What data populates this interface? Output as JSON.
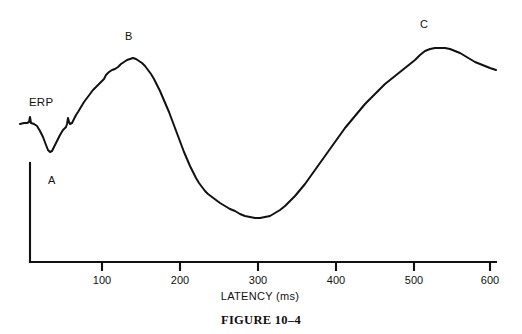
{
  "figure": {
    "caption": "FIGURE 10–4",
    "background_color": "#ffffff",
    "trace_color": "#111111",
    "axis_color": "#111111"
  },
  "chart_data": {
    "type": "line",
    "title": "",
    "subtitle": "",
    "xlabel": "LATENCY (ms)",
    "ylabel": "",
    "grid": false,
    "legend_position": "none",
    "xlim": [
      0,
      645
    ],
    "ylim": [
      -1,
      1
    ],
    "x_ticks": [
      100,
      200,
      300,
      400,
      500,
      600
    ],
    "x_tick_labels": [
      "100",
      "200",
      "300",
      "400",
      "500",
      "600"
    ],
    "y_ticks": [],
    "y_tick_labels": [],
    "series": [
      {
        "name": "ERP",
        "points_px": [
          [
            20,
            124
          ],
          [
            24,
            123
          ],
          [
            27,
            123
          ],
          [
            29,
            122
          ],
          [
            30,
            117
          ],
          [
            31,
            123
          ],
          [
            34,
            124
          ],
          [
            37,
            126
          ],
          [
            40,
            131
          ],
          [
            43,
            137
          ],
          [
            46,
            145
          ],
          [
            48,
            150
          ],
          [
            50,
            152
          ],
          [
            52,
            151
          ],
          [
            54,
            147
          ],
          [
            57,
            141
          ],
          [
            60,
            135
          ],
          [
            63,
            130
          ],
          [
            66,
            127
          ],
          [
            67,
            124
          ],
          [
            68,
            118
          ],
          [
            69,
            122
          ],
          [
            70,
            124
          ],
          [
            72,
            123
          ],
          [
            74,
            119
          ],
          [
            76,
            115
          ],
          [
            78,
            112
          ],
          [
            81,
            107
          ],
          [
            84,
            102
          ],
          [
            87,
            98
          ],
          [
            90,
            94
          ],
          [
            93,
            90
          ],
          [
            96,
            87
          ],
          [
            99,
            84
          ],
          [
            102,
            81
          ],
          [
            104,
            79
          ],
          [
            106,
            75
          ],
          [
            109,
            72
          ],
          [
            112,
            70
          ],
          [
            115,
            69
          ],
          [
            118,
            67
          ],
          [
            121,
            64
          ],
          [
            124,
            62
          ],
          [
            127,
            60
          ],
          [
            130,
            59
          ],
          [
            133,
            58
          ],
          [
            136,
            59
          ],
          [
            139,
            61
          ],
          [
            142,
            63
          ],
          [
            145,
            66
          ],
          [
            148,
            70
          ],
          [
            151,
            74
          ],
          [
            154,
            79
          ],
          [
            157,
            85
          ],
          [
            160,
            91
          ],
          [
            163,
            98
          ],
          [
            166,
            105
          ],
          [
            169,
            112
          ],
          [
            172,
            120
          ],
          [
            175,
            128
          ],
          [
            178,
            136
          ],
          [
            181,
            144
          ],
          [
            184,
            152
          ],
          [
            187,
            159
          ],
          [
            190,
            166
          ],
          [
            193,
            172
          ],
          [
            196,
            178
          ],
          [
            199,
            183
          ],
          [
            202,
            187
          ],
          [
            205,
            191
          ],
          [
            208,
            194
          ],
          [
            212,
            197
          ],
          [
            216,
            200
          ],
          [
            220,
            203
          ],
          [
            225,
            206
          ],
          [
            230,
            209
          ],
          [
            235,
            211
          ],
          [
            240,
            214
          ],
          [
            245,
            216
          ],
          [
            250,
            217
          ],
          [
            255,
            218
          ],
          [
            260,
            218
          ],
          [
            265,
            217
          ],
          [
            270,
            216
          ],
          [
            275,
            213
          ],
          [
            280,
            210
          ],
          [
            285,
            206
          ],
          [
            290,
            201
          ],
          [
            295,
            196
          ],
          [
            300,
            190
          ],
          [
            305,
            184
          ],
          [
            310,
            177
          ],
          [
            315,
            170
          ],
          [
            320,
            163
          ],
          [
            325,
            156
          ],
          [
            330,
            149
          ],
          [
            335,
            142
          ],
          [
            340,
            135
          ],
          [
            345,
            128
          ],
          [
            350,
            122
          ],
          [
            355,
            116
          ],
          [
            360,
            110
          ],
          [
            365,
            104
          ],
          [
            370,
            99
          ],
          [
            375,
            94
          ],
          [
            380,
            89
          ],
          [
            385,
            84
          ],
          [
            390,
            80
          ],
          [
            395,
            76
          ],
          [
            400,
            72
          ],
          [
            405,
            68
          ],
          [
            410,
            64
          ],
          [
            415,
            60
          ],
          [
            420,
            55
          ],
          [
            425,
            51
          ],
          [
            430,
            49
          ],
          [
            435,
            48
          ],
          [
            440,
            48
          ],
          [
            445,
            48
          ],
          [
            450,
            49
          ],
          [
            455,
            51
          ],
          [
            460,
            53
          ],
          [
            465,
            56
          ],
          [
            470,
            59
          ],
          [
            475,
            62
          ],
          [
            480,
            64
          ],
          [
            485,
            66
          ],
          [
            490,
            68
          ],
          [
            496,
            70
          ]
        ],
        "landmarks": [
          {
            "label": "A",
            "type": "trough",
            "x_ms": 40,
            "px": [
              48,
              152
            ]
          },
          {
            "label": "B",
            "type": "peak",
            "x_ms": 140,
            "px": [
              133,
              58
            ]
          },
          {
            "label": "C",
            "type": "peak",
            "x_ms": 545,
            "px": [
              436,
              48
            ]
          }
        ]
      }
    ],
    "annotations": [
      {
        "id": "erp-label",
        "text": "ERP",
        "px": [
          29,
          96
        ]
      },
      {
        "id": "label-a",
        "text": "A",
        "px": [
          48,
          174
        ]
      },
      {
        "id": "label-b",
        "text": "B",
        "px": [
          125,
          30
        ]
      },
      {
        "id": "label-c",
        "text": "C",
        "px": [
          420,
          18
        ]
      }
    ]
  },
  "axes": {
    "x_axis": {
      "title": "LATENCY (ms)",
      "title_px": [
        260,
        290
      ],
      "line_px": {
        "x1": 30,
        "y1": 262,
        "x2": 496,
        "y2": 262
      },
      "ticks": [
        {
          "label": "100",
          "x_px": 102
        },
        {
          "label": "200",
          "x_px": 180
        },
        {
          "label": "300",
          "x_px": 258
        },
        {
          "label": "400",
          "x_px": 336
        },
        {
          "label": "500",
          "x_px": 414
        },
        {
          "label": "600",
          "x_px": 490
        }
      ],
      "tick_length_px": 9,
      "tick_label_y_px": 274
    },
    "y_axis": {
      "line_px": {
        "x1": 30,
        "y1": 163,
        "x2": 30,
        "y2": 262
      },
      "scale_bar": true
    }
  }
}
